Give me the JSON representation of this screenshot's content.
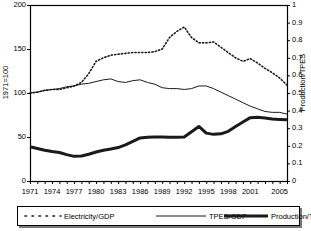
{
  "chart_data": {
    "type": "line",
    "title": "",
    "xlabel": "",
    "ylabel": "1971=100",
    "ylabel_right": "Production/TPES",
    "xlim": [
      1971,
      2006
    ],
    "ylim": [
      0,
      200
    ],
    "ylim_right": [
      0,
      1
    ],
    "grid": false,
    "legend_position": "bottom",
    "x": [
      1971,
      1972,
      1973,
      1974,
      1975,
      1976,
      1977,
      1978,
      1979,
      1980,
      1981,
      1982,
      1983,
      1984,
      1985,
      1986,
      1987,
      1988,
      1989,
      1990,
      1991,
      1992,
      1993,
      1994,
      1995,
      1996,
      1997,
      1998,
      1999,
      2000,
      2001,
      2002,
      2003,
      2004,
      2005,
      2006
    ],
    "xtick_labels": [
      "1971",
      "1974",
      "1977",
      "1980",
      "1983",
      "1986",
      "1989",
      "1992",
      "1995",
      "1998",
      "2001",
      "2005"
    ],
    "xtick_values": [
      1971,
      1974,
      1977,
      1980,
      1983,
      1986,
      1989,
      1992,
      1995,
      1998,
      2001,
      2005
    ],
    "ytick_labels_left": [
      "0",
      "50",
      "100",
      "150",
      "200"
    ],
    "ytick_values_left": [
      0,
      50,
      100,
      150,
      200
    ],
    "ytick_labels_right": [
      "0",
      "0.1",
      "0.2",
      "0.3",
      "0.4",
      "0.5",
      "0.6",
      "0.7",
      "0.8",
      "0.9",
      "1"
    ],
    "ytick_values_right": [
      0,
      0.1,
      0.2,
      0.3,
      0.4,
      0.5,
      0.6,
      0.7,
      0.8,
      0.9,
      1
    ],
    "series": [
      {
        "name": "Electricity/GDP",
        "axis": "left",
        "style": "dotted",
        "values": [
          100,
          101,
          103,
          104,
          104,
          106,
          108,
          112,
          122,
          136,
          140,
          143,
          144,
          145,
          146,
          146,
          146,
          147,
          150,
          163,
          170,
          175,
          163,
          157,
          157,
          158,
          152,
          146,
          140,
          136,
          139,
          134,
          128,
          123,
          117,
          109
        ]
      },
      {
        "name": "TPES/GDP",
        "axis": "left",
        "style": "thin-solid",
        "values": [
          100,
          101,
          103,
          104,
          105,
          107,
          108,
          110,
          111,
          113,
          115,
          116,
          113,
          112,
          114,
          115,
          112,
          110,
          106,
          105,
          105,
          104,
          105,
          108,
          108,
          105,
          101,
          97,
          93,
          89,
          85,
          82,
          79,
          78,
          78,
          76
        ]
      },
      {
        "name": "Production/TPES",
        "axis": "right",
        "style": "thick-solid",
        "values": [
          0.195,
          0.185,
          0.175,
          0.168,
          0.162,
          0.15,
          0.14,
          0.142,
          0.152,
          0.165,
          0.175,
          0.182,
          0.19,
          0.205,
          0.225,
          0.245,
          0.248,
          0.25,
          0.25,
          0.248,
          0.248,
          0.25,
          0.28,
          0.31,
          0.272,
          0.265,
          0.268,
          0.282,
          0.31,
          0.335,
          0.36,
          0.362,
          0.358,
          0.352,
          0.35,
          0.348
        ]
      }
    ]
  },
  "legend": {
    "items": [
      {
        "label": "Electricity/GDP",
        "style": "dotted"
      },
      {
        "label": "TPES/GDP",
        "style": "thin-solid"
      },
      {
        "label": "Production/TPES",
        "style": "thick-solid"
      }
    ]
  },
  "colors": {
    "line": "#1a1a1a",
    "axis": "#000000",
    "background": "#ffffff"
  }
}
